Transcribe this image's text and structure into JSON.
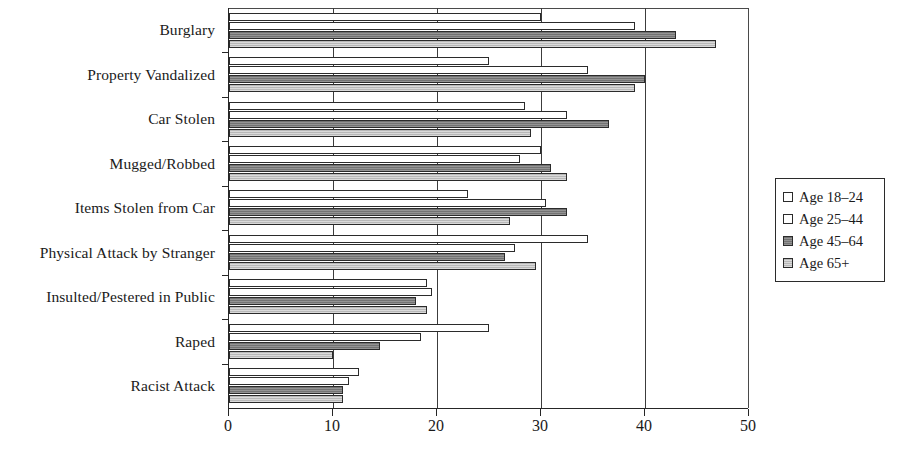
{
  "chart_data": {
    "type": "bar",
    "orientation": "horizontal",
    "title": "",
    "xlabel": "",
    "ylabel": "",
    "xlim": [
      0,
      50
    ],
    "xticks": [
      0,
      10,
      20,
      30,
      40,
      50
    ],
    "xtick_labels": [
      "0",
      "10",
      "20",
      "30",
      "40",
      "50"
    ],
    "grid": true,
    "grid_axis": "x",
    "legend_position": "right",
    "categories": [
      "Burglary",
      "Property Vandalized",
      "Car Stolen",
      "Mugged/Robbed",
      "Items Stolen from Car",
      "Physical Attack by Stranger",
      "Insulted/Pestered in Public",
      "Raped",
      "Racist Attack"
    ],
    "series": [
      {
        "name": "Age 18–24",
        "color": "#ffffff",
        "swatch": "swatch-18",
        "values": [
          30,
          25,
          28.5,
          30,
          23,
          34.5,
          19,
          25,
          12.5
        ]
      },
      {
        "name": "Age 25–44",
        "color": "#ffffff",
        "swatch": "swatch-25",
        "values": [
          39,
          34.5,
          32.5,
          28,
          30.5,
          27.5,
          19.5,
          18.5,
          11.5
        ]
      },
      {
        "name": "Age 45–64",
        "color": "#808080",
        "swatch": "swatch-45",
        "values": [
          43,
          40,
          36.5,
          31,
          32.5,
          26.5,
          18,
          14.5,
          11
        ]
      },
      {
        "name": "Age 65+",
        "color": "#c6c6c6",
        "swatch": "swatch-65",
        "values": [
          46.8,
          39,
          29,
          32.5,
          27,
          29.5,
          19,
          10,
          11
        ]
      }
    ]
  },
  "legend": {
    "items": [
      {
        "label": "Age 18–24",
        "swatch": "swatch-18"
      },
      {
        "label": "Age 25–44",
        "swatch": "swatch-25"
      },
      {
        "label": "Age 45–64",
        "swatch": "swatch-45"
      },
      {
        "label": "Age 65+",
        "swatch": "swatch-65"
      }
    ]
  }
}
